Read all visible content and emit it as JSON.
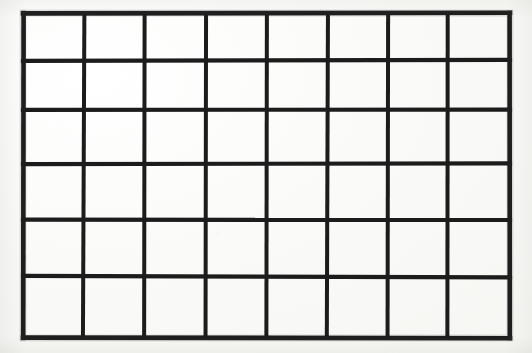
{
  "document": {
    "kind": "scanned-grid-figure",
    "title": "Blank grid",
    "background_color": "#fbfbf9",
    "ink_color": "#1c1c1c"
  },
  "grid": {
    "columns": 8,
    "rows": 6,
    "cell_count": 48,
    "bounds": {
      "x": 23,
      "y": 13,
      "width": 487,
      "height": 325
    },
    "line_width_outer": 4.6,
    "line_width_inner": 4.0,
    "column_edges_x": [
      23,
      84,
      145,
      206,
      267,
      328,
      388,
      448,
      510
    ],
    "row_edges_y": [
      13,
      61,
      110,
      164,
      220,
      277,
      338
    ],
    "column_labels": [
      "1",
      "2",
      "3",
      "4",
      "5",
      "6",
      "7",
      "8"
    ],
    "row_labels": [
      "1",
      "2",
      "3",
      "4",
      "5",
      "6"
    ],
    "cells": [
      [
        "",
        "",
        "",
        "",
        "",
        "",
        "",
        ""
      ],
      [
        "",
        "",
        "",
        "",
        "",
        "",
        "",
        ""
      ],
      [
        "",
        "",
        "",
        "",
        "",
        "",
        "",
        ""
      ],
      [
        "",
        "",
        "",
        "",
        "",
        "",
        "",
        ""
      ],
      [
        "",
        "",
        "",
        "",
        "",
        "",
        "",
        ""
      ],
      [
        "",
        "",
        "",
        "",
        "",
        "",
        "",
        ""
      ]
    ]
  }
}
